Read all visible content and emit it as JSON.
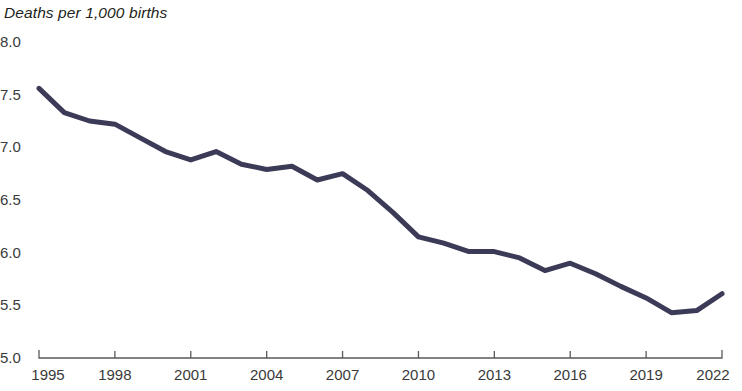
{
  "chart_data": {
    "type": "line",
    "title": "Deaths per 1,000 births",
    "xlabel": "",
    "ylabel": "Deaths per 1,000 births",
    "grid": false,
    "legend": "none",
    "line_color": "#3b3b58",
    "axis_color": "#5a5a5a",
    "xlim": [
      1995,
      2022
    ],
    "ylim": [
      5.0,
      8.0
    ],
    "ytick_labels": [
      "8.0",
      "7.5",
      "7.0",
      "6.5",
      "6.0",
      "5.5",
      "5.0"
    ],
    "ytick_values": [
      8.0,
      7.5,
      7.0,
      6.5,
      6.0,
      5.5,
      5.0
    ],
    "xtick_labels": [
      "1995",
      "1998",
      "2001",
      "2004",
      "2007",
      "2010",
      "2013",
      "2016",
      "2019",
      "2022"
    ],
    "xtick_values": [
      1995,
      1998,
      2001,
      2004,
      2007,
      2010,
      2013,
      2016,
      2019,
      2022
    ],
    "x": [
      1995,
      1996,
      1997,
      1998,
      1999,
      2000,
      2001,
      2002,
      2003,
      2004,
      2005,
      2006,
      2007,
      2008,
      2009,
      2010,
      2011,
      2012,
      2013,
      2014,
      2015,
      2016,
      2017,
      2018,
      2019,
      2020,
      2021,
      2022
    ],
    "values": [
      7.56,
      7.33,
      7.25,
      7.22,
      7.09,
      6.96,
      6.88,
      6.96,
      6.84,
      6.79,
      6.82,
      6.69,
      6.75,
      6.59,
      6.38,
      6.15,
      6.09,
      6.01,
      6.01,
      5.95,
      5.83,
      5.9,
      5.8,
      5.68,
      5.57,
      5.43,
      5.45,
      5.61
    ],
    "series": [
      {
        "name": "Infant mortality rate",
        "values": [
          7.56,
          7.33,
          7.25,
          7.22,
          7.09,
          6.96,
          6.88,
          6.96,
          6.84,
          6.79,
          6.82,
          6.69,
          6.75,
          6.59,
          6.38,
          6.15,
          6.09,
          6.01,
          6.01,
          5.95,
          5.83,
          5.9,
          5.8,
          5.68,
          5.57,
          5.43,
          5.45,
          5.61
        ]
      }
    ]
  }
}
